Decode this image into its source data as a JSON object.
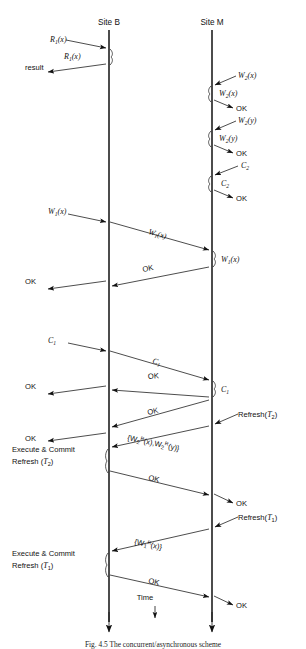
{
  "figure": {
    "caption": "Fig. 4.5 The concurrent/asynchronous scheme",
    "time_axis_label": "Time",
    "lifelines": [
      {
        "id": "siteB",
        "label": "Site B",
        "x": 109,
        "top": 30,
        "bottom": 625
      },
      {
        "id": "siteM",
        "label": "Site M",
        "x": 212,
        "top": 30,
        "bottom": 625
      }
    ],
    "left_labels": [
      {
        "text": "result",
        "x": 28,
        "y": 66
      },
      {
        "text": "OK",
        "x": 26,
        "y": 281
      },
      {
        "text": "OK",
        "x": 26,
        "y": 386
      },
      {
        "text": "OK",
        "x": 26,
        "y": 438
      }
    ],
    "right_labels": [
      {
        "text": "OK",
        "x": 236,
        "y": 104
      },
      {
        "text": "OK",
        "x": 236,
        "y": 149
      },
      {
        "text": "OK",
        "x": 236,
        "y": 194
      },
      {
        "text": "OK",
        "x": 236,
        "y": 500
      },
      {
        "text": "OK",
        "x": 236,
        "y": 602
      }
    ],
    "block_labels": [
      {
        "line1": "Execute & Commit",
        "line2_pre": "Refresh (",
        "line2_var": "T",
        "line2_sub": "2",
        "line2_post": ")",
        "x": 14,
        "y": 451
      },
      {
        "line1": "Execute & Commit",
        "line2_pre": "Refresh (",
        "line2_var": "T",
        "line2_sub": "1",
        "line2_post": ")",
        "x": 14,
        "y": 556
      }
    ],
    "messages": [
      {
        "name": "R1x-in",
        "var": "R",
        "sub": "1",
        "arg": "(x)",
        "label_x": 50,
        "label_y": 42,
        "type": "italic"
      },
      {
        "name": "R1x-self",
        "var": "R",
        "sub": "1",
        "arg": "(x)",
        "label_x": 64,
        "label_y": 57,
        "type": "italic"
      },
      {
        "name": "W2x-in",
        "var": "W",
        "sub": "2",
        "arg": "(x)",
        "label_x": 240,
        "label_y": 80,
        "type": "italic"
      },
      {
        "name": "W2x-self",
        "var": "W",
        "sub": "2",
        "arg": "(x)",
        "label_x": 222,
        "label_y": 95,
        "type": "italic"
      },
      {
        "name": "W2y-in",
        "var": "W",
        "sub": "2",
        "arg": "(y)",
        "label_x": 240,
        "label_y": 125,
        "type": "italic"
      },
      {
        "name": "W2y-self",
        "var": "W",
        "sub": "2",
        "arg": "(y)",
        "label_x": 222,
        "label_y": 140,
        "type": "italic"
      },
      {
        "name": "C2-in",
        "var": "C",
        "sub": "2",
        "arg": "",
        "label_x": 243,
        "label_y": 170,
        "type": "italic"
      },
      {
        "name": "C2-self",
        "var": "C",
        "sub": "2",
        "arg": "",
        "label_x": 224,
        "label_y": 185,
        "type": "italic"
      },
      {
        "name": "W1x-in",
        "var": "W",
        "sub": "1",
        "arg": "(x)",
        "label_x": 50,
        "label_y": 216,
        "type": "italic"
      },
      {
        "name": "W1x-transit",
        "var": "W",
        "sub": "1",
        "arg": "(x)",
        "label_x": 152,
        "label_y": 235,
        "type": "italic"
      },
      {
        "name": "W1x-self",
        "var": "W",
        "sub": "1",
        "arg": "(x)",
        "label_x": 224,
        "label_y": 262,
        "type": "italic"
      },
      {
        "name": "C1-in",
        "var": "C",
        "sub": "1",
        "arg": "",
        "label_x": 50,
        "label_y": 345,
        "type": "italic"
      },
      {
        "name": "C1-transit",
        "var": "C",
        "sub": "1",
        "arg": "",
        "label_x": 155,
        "label_y": 362,
        "type": "italic"
      },
      {
        "name": "C1-self",
        "var": "C",
        "sub": "1",
        "arg": "",
        "label_x": 224,
        "label_y": 391,
        "type": "italic"
      }
    ],
    "ok_transit_labels": [
      {
        "text": "OK",
        "x": 148,
        "y": 270,
        "rot": 7
      },
      {
        "text": "OK",
        "x": 152,
        "y": 375,
        "rot": 7
      },
      {
        "text": "OK",
        "x": 152,
        "y": 412,
        "rot": 7
      },
      {
        "text": "OK",
        "x": 152,
        "y": 478,
        "rot": -7
      },
      {
        "text": "OK",
        "x": 152,
        "y": 581,
        "rot": -7
      }
    ],
    "refresh_labels": [
      {
        "pre": "Refresh(",
        "var": "T",
        "sub": "2",
        "post": ")",
        "x": 240,
        "y": 421
      },
      {
        "pre": "Refresh(",
        "var": "T",
        "sub": "1",
        "post": ")",
        "x": 240,
        "y": 524
      }
    ],
    "refresh_payloads": [
      {
        "text": "{W",
        "sub1": "2",
        "sup1": "R",
        "mid": "(x),W",
        "sub2": "2",
        "sup2": "R",
        "end": "(y)}",
        "x": 129,
        "y": 441,
        "rot": 7
      },
      {
        "text": "{W",
        "sub1": "1",
        "sup1": "R",
        "mid": "",
        "sub2": "",
        "sup2": "",
        "end": "(x)}",
        "x": 136,
        "y": 545,
        "rot": 7
      }
    ]
  }
}
